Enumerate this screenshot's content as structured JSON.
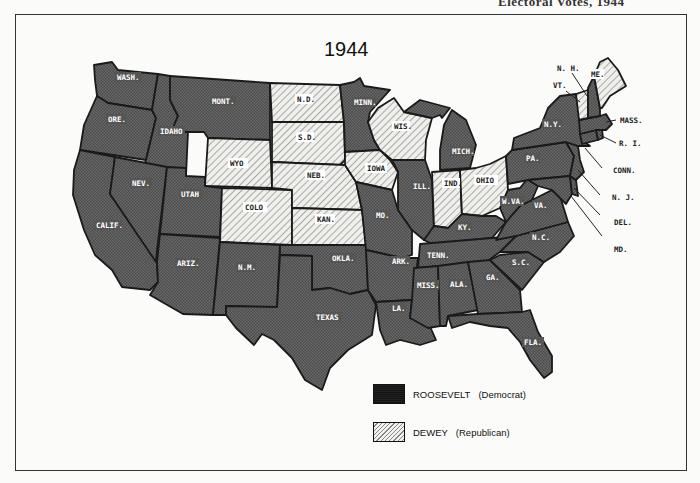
{
  "page_header": "Electoral Votes, 1944",
  "map": {
    "title": "1944",
    "colors": {
      "roosevelt_fill": "#5e5e5e",
      "dewey_fill": "#e6e6e2",
      "border": "#1a1a1a"
    },
    "legend": [
      {
        "candidate": "ROOSEVELT",
        "party": "(Democrat)",
        "pattern": "crosshatch-dark"
      },
      {
        "candidate": "DEWEY",
        "party": "(Republican)",
        "pattern": "diagonal-light"
      }
    ],
    "states": {
      "roosevelt": [
        "WASH.",
        "ORE.",
        "CALIF.",
        "IDAHO",
        "NEV.",
        "MONT.",
        "UTAH",
        "ARIZ.",
        "N.M.",
        "TEXAS",
        "OKLA.",
        "MINN.",
        "MO.",
        "ARK.",
        "LA.",
        "ILL.",
        "MICH.",
        "KY.",
        "TENN.",
        "MISS.",
        "ALA.",
        "GA.",
        "FLA.",
        "S.C.",
        "N.C.",
        "VA.",
        "W.VA.",
        "PA.",
        "N.Y.",
        "MASS.",
        "R.I.",
        "CONN.",
        "N.J.",
        "DEL.",
        "MD."
      ],
      "dewey": [
        "WYO",
        "COLO",
        "N.D.",
        "S.D.",
        "NEB.",
        "KAN.",
        "IOWA",
        "WIS.",
        "IND.",
        "OHIO",
        "VT.",
        "ME."
      ]
    },
    "callout_labels": [
      "N.H.",
      "VT.",
      "MASS.",
      "R.I.",
      "CONN.",
      "N.J.",
      "DEL.",
      "MD."
    ]
  }
}
